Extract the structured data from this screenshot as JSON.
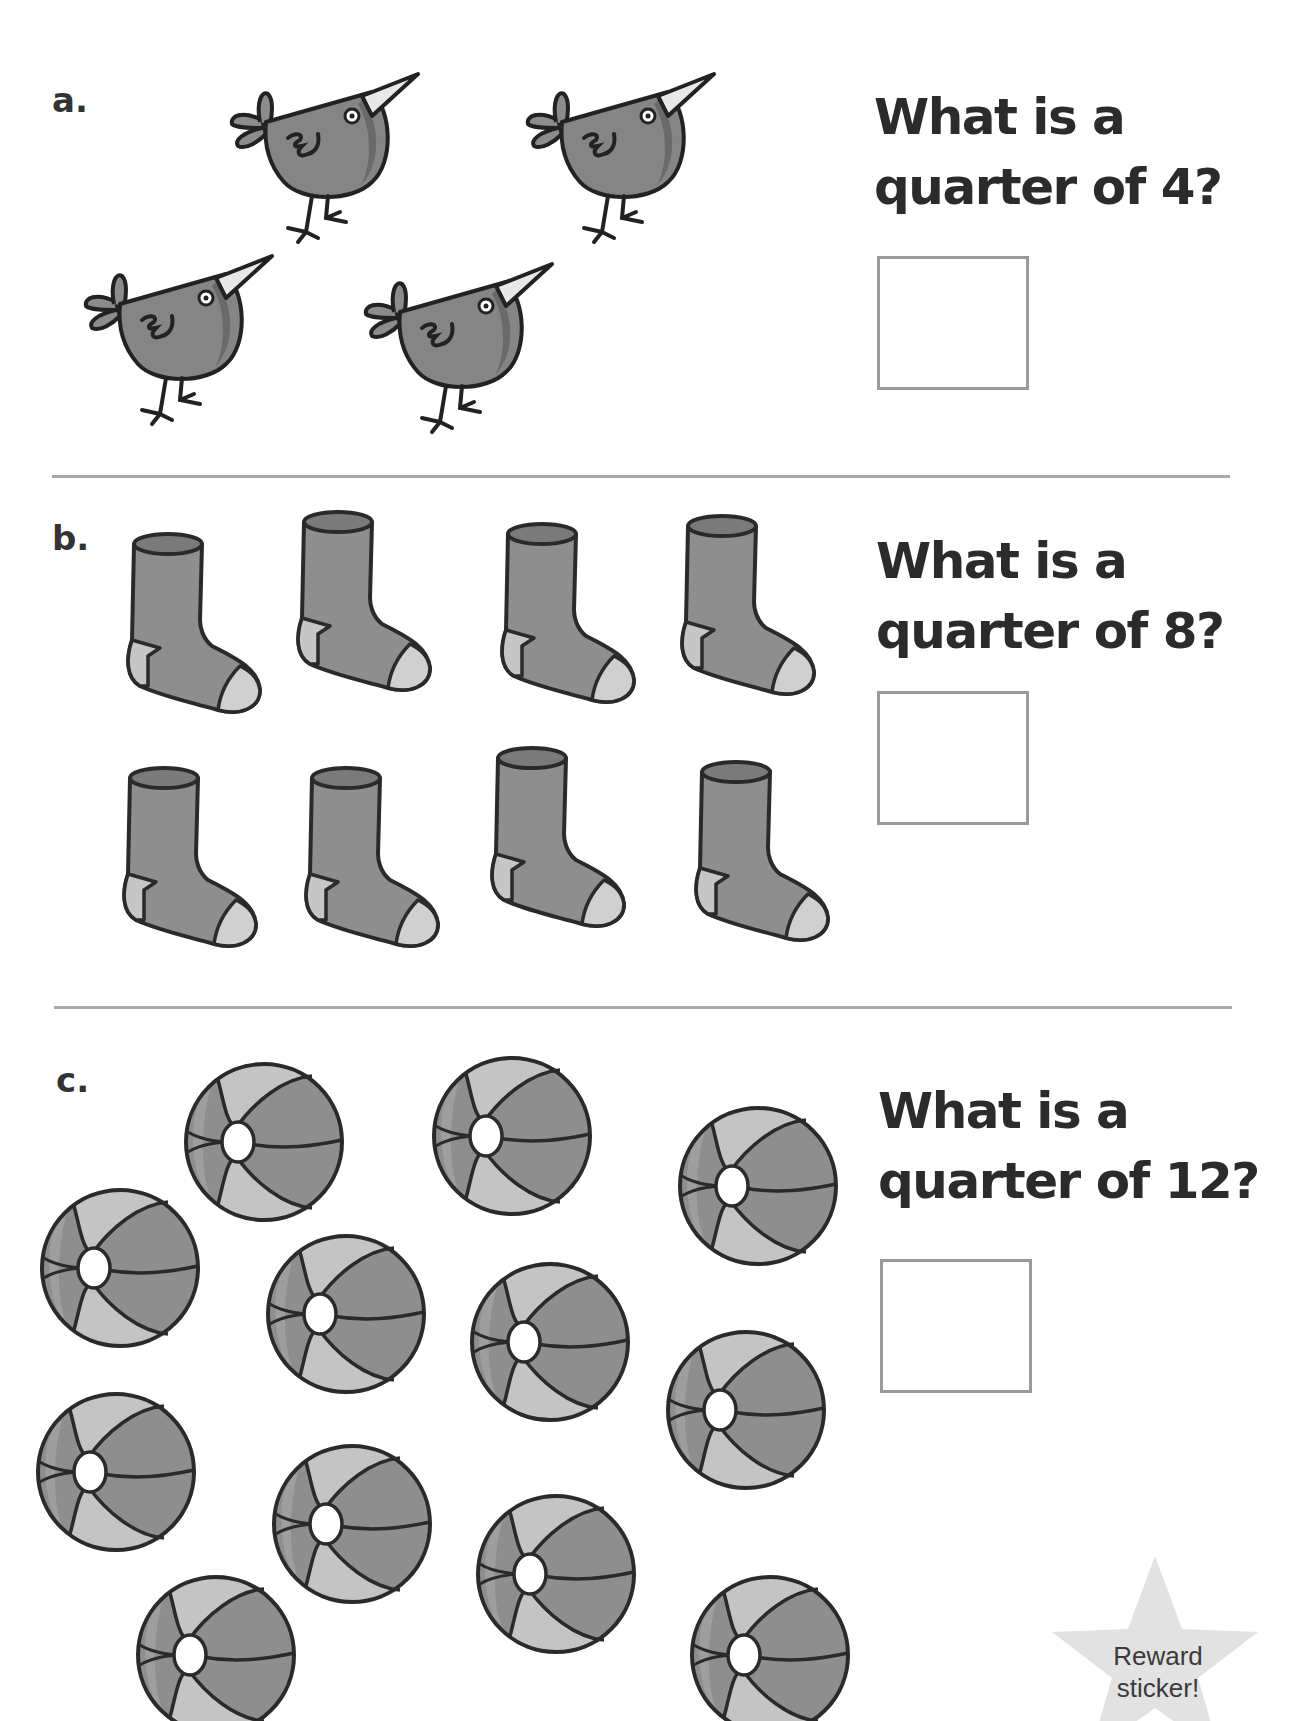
{
  "worksheet": {
    "sections": [
      {
        "label": "a.",
        "question_line1": "What is a",
        "question_line2": "quarter of 4?",
        "object": "bird",
        "object_count": 4,
        "answer_value": ""
      },
      {
        "label": "b.",
        "question_line1": "What is a",
        "question_line2": "quarter of 8?",
        "object": "sock",
        "object_count": 8,
        "answer_value": ""
      },
      {
        "label": "c.",
        "question_line1": "What is a",
        "question_line2": "quarter of 12?",
        "object": "beach-ball",
        "object_count": 12,
        "answer_value": ""
      }
    ],
    "reward": {
      "line1": "Reward",
      "line2": "sticker!"
    }
  },
  "colors": {
    "illustration_fill": "#8a8a8a",
    "illustration_light": "#c4c4c4",
    "outline": "#2a2a2a",
    "divider": "#a8a8a8",
    "answer_box_border": "#9a9a9a",
    "star_fill": "#e2e2e2"
  }
}
